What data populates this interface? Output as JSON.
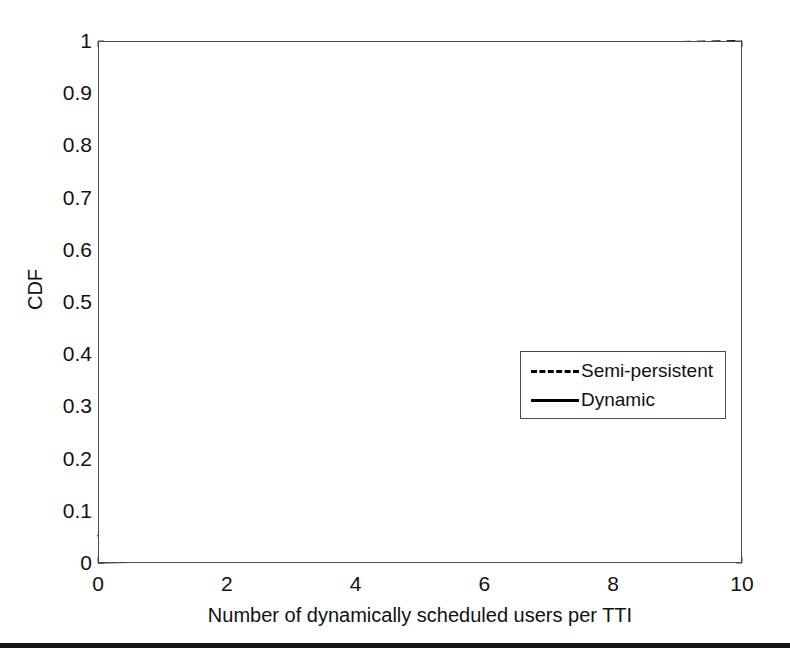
{
  "chart_data": {
    "type": "line",
    "title": "",
    "xlabel": "Number of dynamically scheduled users per TTI",
    "ylabel": "CDF",
    "xlim": [
      0,
      10
    ],
    "ylim": [
      0,
      1
    ],
    "xticks": [
      "0",
      "2",
      "4",
      "6",
      "8",
      "10"
    ],
    "xtick_values": [
      0,
      2,
      4,
      6,
      8,
      10
    ],
    "yticks": [
      "0",
      "0.1",
      "0.2",
      "0.3",
      "0.4",
      "0.5",
      "0.6",
      "0.7",
      "0.8",
      "0.9",
      "1"
    ],
    "ytick_values": [
      0,
      0.1,
      0.2,
      0.3,
      0.4,
      0.5,
      0.6,
      0.7,
      0.8,
      0.9,
      1
    ],
    "grid": true,
    "legend_position": "center-right",
    "x": [
      0,
      1,
      2,
      3,
      4,
      5,
      6,
      7,
      8,
      9,
      10
    ],
    "series": [
      {
        "name": "Semi-persistent",
        "style": "dashed",
        "color": "#000000",
        "values": [
          0.05,
          0.15,
          0.29,
          0.77,
          0.9,
          0.955,
          0.982,
          0.991,
          0.995,
          0.997,
          0.999
        ]
      },
      {
        "name": "Dynamic",
        "style": "solid",
        "color": "#000000",
        "values": [
          0.002,
          0.004,
          0.01,
          0.05,
          0.12,
          0.25,
          0.5,
          0.7,
          0.855,
          0.965,
          0.995
        ]
      }
    ],
    "extra_points": {
      "Semi-persistent": [
        [
          0,
          0.05
        ],
        [
          0.5,
          0.095
        ],
        [
          1,
          0.15
        ],
        [
          1.5,
          0.215
        ],
        [
          2,
          0.29
        ],
        [
          2.25,
          0.36
        ],
        [
          2.5,
          0.47
        ],
        [
          2.75,
          0.61
        ],
        [
          3,
          0.77
        ],
        [
          3.25,
          0.825
        ],
        [
          3.5,
          0.862
        ],
        [
          4,
          0.9
        ],
        [
          4.5,
          0.935
        ],
        [
          5,
          0.955
        ],
        [
          5.5,
          0.972
        ],
        [
          6,
          0.982
        ],
        [
          7,
          0.991
        ],
        [
          8,
          0.995
        ],
        [
          9,
          0.997
        ],
        [
          10,
          0.999
        ]
      ],
      "Dynamic": [
        [
          0,
          0.002
        ],
        [
          1,
          0.004
        ],
        [
          1.5,
          0.006
        ],
        [
          2,
          0.01
        ],
        [
          2.5,
          0.022
        ],
        [
          3,
          0.05
        ],
        [
          3.5,
          0.082
        ],
        [
          4,
          0.12
        ],
        [
          4.5,
          0.18
        ],
        [
          5,
          0.25
        ],
        [
          5.5,
          0.37
        ],
        [
          6,
          0.5
        ],
        [
          6.5,
          0.6
        ],
        [
          7,
          0.7
        ],
        [
          7.5,
          0.785
        ],
        [
          8,
          0.855
        ],
        [
          8.5,
          0.915
        ],
        [
          9,
          0.965
        ],
        [
          9.5,
          0.985
        ],
        [
          10,
          0.995
        ]
      ]
    }
  },
  "legend": {
    "items": [
      {
        "label": "Semi-persistent",
        "style": "dashed"
      },
      {
        "label": "Dynamic",
        "style": "solid"
      }
    ]
  },
  "colors": {
    "axis": "#4a4a4a",
    "grid": "#d8d8d8",
    "line": "#000000",
    "background": "#ffffff",
    "text": "#111111"
  }
}
